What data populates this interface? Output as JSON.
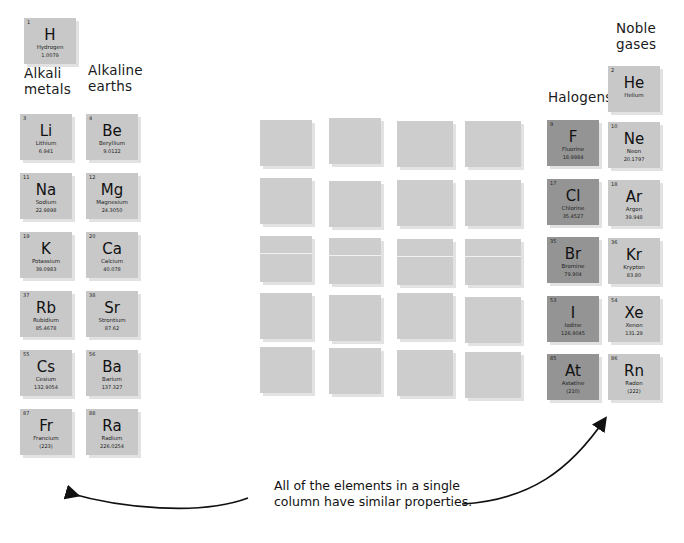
{
  "figure": {
    "caption": "All of the elements in a single\ncolumn have similar properties."
  },
  "labels": {
    "alkali_metals": "Alkali\nmetals",
    "alkaline_earths": "Alkaline\nearths",
    "halogens": "Halogens",
    "noble_gases": "Noble\ngases"
  },
  "colors": {
    "tile_light": "#c8c8c8",
    "tile_dark": "#949494",
    "tile_blank": "#cdcdcd",
    "tile_shadow": "#e2e2e2",
    "page_background": "#ffffff",
    "text": "#111111",
    "arrow": "#111111"
  },
  "hydrogen": {
    "number": "1",
    "symbol": "H",
    "name": "Hydrogen",
    "mass": "1.0079"
  },
  "columns": {
    "alkali_metals": [
      {
        "number": "3",
        "symbol": "Li",
        "name": "Lithium",
        "mass": "6.941"
      },
      {
        "number": "11",
        "symbol": "Na",
        "name": "Sodium",
        "mass": "22.9898"
      },
      {
        "number": "19",
        "symbol": "K",
        "name": "Potassium",
        "mass": "39.0983"
      },
      {
        "number": "37",
        "symbol": "Rb",
        "name": "Rubidium",
        "mass": "85.4678"
      },
      {
        "number": "55",
        "symbol": "Cs",
        "name": "Cesium",
        "mass": "132.9054"
      },
      {
        "number": "87",
        "symbol": "Fr",
        "name": "Francium",
        "mass": "(223)"
      }
    ],
    "alkaline_earths": [
      {
        "number": "4",
        "symbol": "Be",
        "name": "Beryllium",
        "mass": "9.0122"
      },
      {
        "number": "12",
        "symbol": "Mg",
        "name": "Magnesium",
        "mass": "24.3050"
      },
      {
        "number": "20",
        "symbol": "Ca",
        "name": "Calcium",
        "mass": "40.078"
      },
      {
        "number": "38",
        "symbol": "Sr",
        "name": "Strontium",
        "mass": "87.62"
      },
      {
        "number": "56",
        "symbol": "Ba",
        "name": "Barium",
        "mass": "137.327"
      },
      {
        "number": "88",
        "symbol": "Ra",
        "name": "Radium",
        "mass": "226.0254"
      }
    ],
    "halogens": [
      {
        "number": "9",
        "symbol": "F",
        "name": "Fluorine",
        "mass": "18.9984"
      },
      {
        "number": "17",
        "symbol": "Cl",
        "name": "Chlorine",
        "mass": "35.4527"
      },
      {
        "number": "35",
        "symbol": "Br",
        "name": "Bromine",
        "mass": "79.904"
      },
      {
        "number": "53",
        "symbol": "I",
        "name": "Iodine",
        "mass": "126.9045"
      },
      {
        "number": "85",
        "symbol": "At",
        "name": "Astatine",
        "mass": "(210)"
      }
    ],
    "noble_gases": [
      {
        "number": "2",
        "symbol": "He",
        "name": "Helium",
        "mass": ""
      },
      {
        "number": "10",
        "symbol": "Ne",
        "name": "Neon",
        "mass": "20.1797"
      },
      {
        "number": "18",
        "symbol": "Ar",
        "name": "Argon",
        "mass": "39.948"
      },
      {
        "number": "36",
        "symbol": "Kr",
        "name": "Krypton",
        "mass": "83.80"
      },
      {
        "number": "54",
        "symbol": "Xe",
        "name": "Xenon",
        "mass": "131.29"
      },
      {
        "number": "86",
        "symbol": "Rn",
        "name": "Radon",
        "mass": "(222)"
      }
    ]
  },
  "blank_block": {
    "column_count": 4,
    "row_count": 5,
    "note": ""
  }
}
